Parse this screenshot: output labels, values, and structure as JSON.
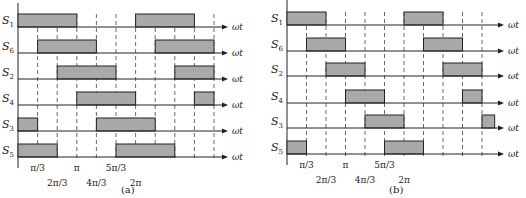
{
  "colors": {
    "pulse_fill": "#a9a9a9",
    "line": "#222222",
    "dash": "#444444",
    "stray_line": "#3a3aa0"
  },
  "axis_label": "ωt",
  "panels": [
    {
      "id": "a",
      "caption": "(a)",
      "x0": 18,
      "step": 19.6,
      "axis_top": 3,
      "axis_bottom": 168,
      "arrow_end": 228,
      "dash_count": 10,
      "dash_bottom": 160,
      "pulse_height": 13,
      "rows": [
        {
          "name": "S",
          "sub": "1",
          "baseline": 27,
          "pulses": [
            [
              0,
              3
            ],
            [
              6,
              9
            ]
          ]
        },
        {
          "name": "S",
          "sub": "6",
          "baseline": 53,
          "pulses": [
            [
              1,
              4
            ],
            [
              7,
              10
            ]
          ]
        },
        {
          "name": "S",
          "sub": "2",
          "baseline": 79,
          "pulses": [
            [
              2,
              5
            ],
            [
              8,
              10
            ]
          ]
        },
        {
          "name": "S",
          "sub": "4",
          "baseline": 105,
          "pulses": [
            [
              3,
              6
            ],
            [
              9,
              10
            ]
          ]
        },
        {
          "name": "S",
          "sub": "3",
          "baseline": 131,
          "pulses": [
            [
              0,
              1
            ],
            [
              4,
              7
            ]
          ]
        },
        {
          "name": "S",
          "sub": "5",
          "baseline": 157,
          "pulses": [
            [
              0,
              2
            ],
            [
              5,
              8
            ]
          ]
        }
      ],
      "ticks": [
        {
          "label": "π/3",
          "k": 1,
          "row": 0
        },
        {
          "label": "2π/3",
          "k": 2,
          "row": 1
        },
        {
          "label": "π",
          "k": 3,
          "row": 0
        },
        {
          "label": "4π/3",
          "k": 4,
          "row": 1
        },
        {
          "label": "5π/3",
          "k": 5,
          "row": 0
        },
        {
          "label": "2π",
          "k": 6,
          "row": 1
        }
      ],
      "conduction": "180°"
    },
    {
      "id": "b",
      "caption": "(b)",
      "x0": 287,
      "step": 19.5,
      "axis_top": 0,
      "axis_bottom": 165,
      "arrow_end": 504,
      "dash_count": 10,
      "dash_bottom": 158,
      "pulse_height": 13,
      "rows": [
        {
          "name": "S",
          "sub": "1",
          "baseline": 25,
          "pulses": [
            [
              0,
              2
            ],
            [
              6,
              8
            ]
          ]
        },
        {
          "name": "S",
          "sub": "6",
          "baseline": 51,
          "pulses": [
            [
              1,
              3
            ],
            [
              7,
              9
            ]
          ]
        },
        {
          "name": "S",
          "sub": "2",
          "baseline": 76,
          "pulses": [
            [
              2,
              4
            ],
            [
              8,
              10
            ]
          ]
        },
        {
          "name": "S",
          "sub": "4",
          "baseline": 103,
          "pulses": [
            [
              3,
              5
            ],
            [
              9,
              10
            ]
          ]
        },
        {
          "name": "S",
          "sub": "3",
          "baseline": 128,
          "pulses": [
            [
              4,
              6
            ],
            [
              10,
              10.65
            ]
          ]
        },
        {
          "name": "S",
          "sub": "5",
          "baseline": 154,
          "pulses": [
            [
              0,
              1
            ],
            [
              5,
              7
            ]
          ]
        }
      ],
      "ticks": [
        {
          "label": "π/3",
          "k": 1,
          "row": 0
        },
        {
          "label": "2π/3",
          "k": 2,
          "row": 1
        },
        {
          "label": "π",
          "k": 3,
          "row": 0
        },
        {
          "label": "4π/3",
          "k": 4,
          "row": 1
        },
        {
          "label": "5π/3",
          "k": 5,
          "row": 0
        },
        {
          "label": "2π",
          "k": 6,
          "row": 1
        }
      ],
      "conduction": "120°"
    }
  ]
}
